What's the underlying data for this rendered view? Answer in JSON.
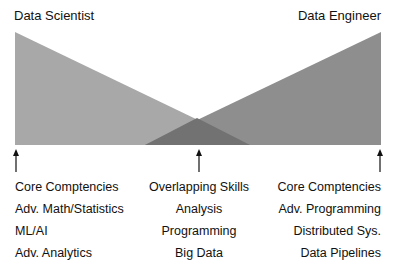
{
  "titles": {
    "left": "Data Scientist",
    "right": "Data Engineer"
  },
  "colors": {
    "left_triangle": "#a8a8a8",
    "right_triangle": "#8e8e8e",
    "overlap": "#727272",
    "arrow": "#111111"
  },
  "columns": {
    "left": {
      "heading": "Core Comptencies",
      "items": [
        "Adv. Math/Statistics",
        "ML/AI",
        "Adv. Analytics"
      ]
    },
    "middle": {
      "heading": "Overlapping Skills",
      "items": [
        "Analysis",
        "Programming",
        "Big Data"
      ]
    },
    "right": {
      "heading": "Core Comptencies",
      "items": [
        "Adv. Programming",
        "Distributed Sys.",
        "Data Pipelines"
      ]
    }
  }
}
